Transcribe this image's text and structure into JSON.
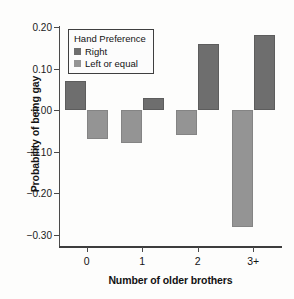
{
  "chart_data": {
    "type": "bar",
    "title": "",
    "xlabel": "Number of older brothers",
    "ylabel": "Probability of being gay",
    "categories": [
      "0",
      "1",
      "2",
      "3+"
    ],
    "series": [
      {
        "name": "Right",
        "color": "#6e6e6e",
        "values": [
          0.07,
          0.03,
          0.16,
          0.18
        ]
      },
      {
        "name": "Left or equal",
        "color": "#949494",
        "values": [
          -0.07,
          -0.08,
          -0.06,
          -0.28
        ]
      }
    ],
    "legend_title": "Hand Preference",
    "legend_position": "upper-left-inside",
    "ylim": [
      -0.33,
      0.21
    ],
    "yticks": [
      0.2,
      0.1,
      0.0,
      -0.1,
      -0.2,
      -0.3
    ],
    "ytick_labels": [
      "0.20",
      "0.10",
      "0.00",
      "-0.10",
      "-0.20",
      "-0.30"
    ],
    "grid": false,
    "baseline": 0.0
  }
}
